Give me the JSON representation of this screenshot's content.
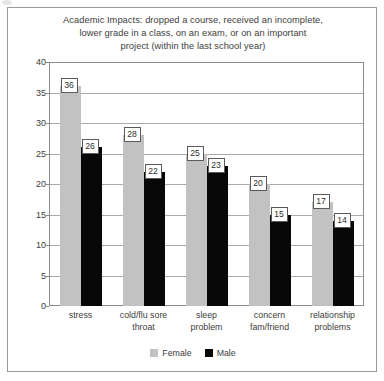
{
  "chart_data": {
    "type": "bar",
    "title": "Academic Impacts: dropped a course, received an incomplete, lower grade in a class, on an exam, or on an important project (within the last school year)",
    "title_lines": [
      "Academic Impacts: dropped a course, received an incomplete,",
      "lower grade in a class, on an exam, or on an important",
      "project (within the last school year)"
    ],
    "categories": [
      "stress",
      "cold/flu sore throat",
      "sleep problem",
      "concern fam/friend",
      "relationship problems"
    ],
    "category_lines": [
      [
        "stress"
      ],
      [
        "cold/flu sore",
        "throat"
      ],
      [
        "sleep",
        "problem"
      ],
      [
        "concern",
        "fam/friend"
      ],
      [
        "relationship",
        "problems"
      ]
    ],
    "series": [
      {
        "name": "Female",
        "values": [
          36,
          28,
          25,
          20,
          17
        ],
        "color": "#c2c2c2"
      },
      {
        "name": "Male",
        "values": [
          26,
          22,
          23,
          15,
          14
        ],
        "color": "#080808"
      }
    ],
    "xlabel": "",
    "ylabel": "",
    "ylim": [
      0,
      40
    ],
    "ytick_step": 5,
    "yticks": [
      0,
      5,
      10,
      15,
      20,
      25,
      30,
      35,
      40
    ],
    "ytick_labels": [
      "0",
      "5",
      "10",
      "15",
      "20",
      "25",
      "30",
      "35",
      "40"
    ],
    "grid": true,
    "grid_axis": "y",
    "legend_position": "bottom",
    "data_labels": true
  }
}
